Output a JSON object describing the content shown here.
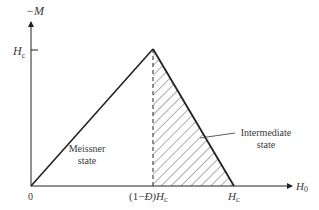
{
  "diagram": {
    "y_axis_label": "−M",
    "x_axis_label": "H",
    "x_axis_label_sub": "0",
    "y_tick_label": "H",
    "y_tick_label_sub": "c",
    "origin_label": "0",
    "x_tick_1_prefix": "(1−",
    "x_tick_1_symbol": "Đ",
    "x_tick_1_suffix": ")H",
    "x_tick_1_sub": "c",
    "x_tick_2_label": "H",
    "x_tick_2_sub": "c",
    "region_left_line1": "Meissner",
    "region_left_line2": "state",
    "region_right_line1": "Intermediate",
    "region_right_line2": "state",
    "colors": {
      "line": "#222222",
      "text": "#3a3a3a",
      "background": "#ffffff"
    }
  }
}
